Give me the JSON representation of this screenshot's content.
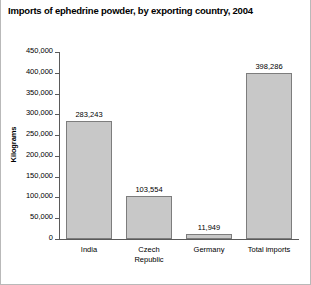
{
  "chart_data": {
    "type": "bar",
    "title": "Imports of ephedrine powder, by exporting country, 2004",
    "xlabel": "",
    "ylabel": "Kilograms",
    "categories": [
      "India",
      "Czech\nRepublic",
      "Germany",
      "Total imports"
    ],
    "values": [
      283243,
      103554,
      11949,
      398286
    ],
    "value_labels": [
      "283,243",
      "103,554",
      "11,949",
      "398,286"
    ],
    "ylim": [
      0,
      450000
    ],
    "ytick_values": [
      0,
      50000,
      100000,
      150000,
      200000,
      250000,
      300000,
      350000,
      400000,
      450000
    ],
    "ytick_labels": [
      "0",
      "50,000",
      "100,000",
      "150,000",
      "200,000",
      "250,000",
      "300,000",
      "350,000",
      "400,000",
      "450,000"
    ],
    "grid": false,
    "legend": false,
    "bar_fill_color": "#c8c8c8",
    "bar_border_color": "#7d7d7d",
    "axis_color": "#5a5a5a"
  }
}
